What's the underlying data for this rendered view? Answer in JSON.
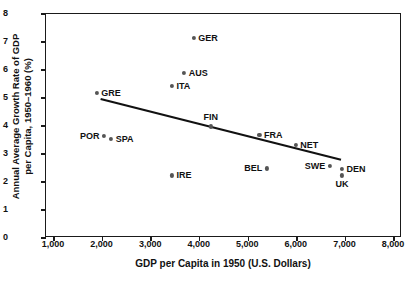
{
  "chart_data": {
    "type": "scatter",
    "title": "",
    "xlabel": "GDP per Capita in 1950 (U.S. Dollars)",
    "ylabel": "Annual Average Growth Rate of GDP per Capita, 1950–1960 (%)",
    "ylabel_line1": "Annual Average Growth Rate of GDP",
    "ylabel_line2": "per Capita, 1950–1960 (%)",
    "xlim": [
      1000,
      8000
    ],
    "ylim": [
      0,
      8
    ],
    "xticks": [
      1000,
      2000,
      3000,
      4000,
      5000,
      6000,
      7000,
      8000
    ],
    "xticklabels": [
      "1,000",
      "2,000",
      "3,000",
      "4,000",
      "5,000",
      "6,000",
      "7,000",
      "8,000"
    ],
    "yticks": [
      0,
      1,
      2,
      3,
      4,
      5,
      6,
      7,
      8
    ],
    "yticklabels": [
      "0",
      "1",
      "2",
      "3",
      "4",
      "5",
      "6",
      "7",
      "8"
    ],
    "grid": false,
    "legend": false,
    "marker_color": "#555555",
    "axis_color": "#1a1a1a",
    "points": [
      {
        "label": "GER",
        "x": 3900,
        "y": 7.1,
        "label_pos": "right"
      },
      {
        "label": "AUS",
        "x": 3700,
        "y": 5.85,
        "label_pos": "right"
      },
      {
        "label": "ITA",
        "x": 3450,
        "y": 5.4,
        "label_pos": "right"
      },
      {
        "label": "GRE",
        "x": 1900,
        "y": 5.15,
        "label_pos": "right"
      },
      {
        "label": "FIN",
        "x": 4250,
        "y": 3.95,
        "label_pos": "above"
      },
      {
        "label": "FRA",
        "x": 5250,
        "y": 3.65,
        "label_pos": "right"
      },
      {
        "label": "POR",
        "x": 2050,
        "y": 3.6,
        "label_pos": "left"
      },
      {
        "label": "SPA",
        "x": 2200,
        "y": 3.5,
        "label_pos": "right"
      },
      {
        "label": "NET",
        "x": 6000,
        "y": 3.3,
        "label_pos": "right"
      },
      {
        "label": "SWE",
        "x": 6700,
        "y": 2.55,
        "label_pos": "left"
      },
      {
        "label": "BEL",
        "x": 5400,
        "y": 2.45,
        "label_pos": "left"
      },
      {
        "label": "DEN",
        "x": 6950,
        "y": 2.42,
        "label_pos": "right"
      },
      {
        "label": "IRE",
        "x": 3450,
        "y": 2.2,
        "label_pos": "right"
      },
      {
        "label": "UK",
        "x": 6950,
        "y": 2.2,
        "label_pos": "below"
      }
    ],
    "trendline": {
      "x_start": 1980,
      "y_start": 4.93,
      "x_end": 6930,
      "y_end": 2.76,
      "color": "#111111",
      "width": 2.2
    }
  }
}
